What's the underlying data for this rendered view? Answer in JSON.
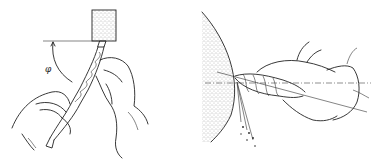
{
  "figure": {
    "panels": [
      {
        "id": "left",
        "view": "front view",
        "elements": [
          "grinding-wheel-block",
          "horizontal-reference-line",
          "angle-arc",
          "twist-drill",
          "left-hand",
          "right-hand"
        ],
        "angle_label": "φ"
      },
      {
        "id": "right",
        "view": "side view",
        "elements": [
          "grinding-wheel-arc",
          "center-line",
          "twist-drill",
          "hands",
          "sparks"
        ]
      }
    ],
    "colors": {
      "ink": "#222222",
      "background": "#ffffff",
      "stipple": "#555555"
    }
  }
}
